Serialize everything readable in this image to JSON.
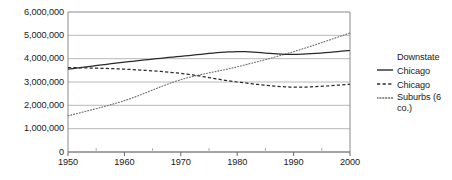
{
  "chart_data": {
    "type": "line",
    "title": "",
    "subtitle": "",
    "xlabel": "",
    "ylabel": "",
    "xlim": [
      1950,
      2000
    ],
    "ylim": [
      0,
      6000000
    ],
    "grid": true,
    "grid_axis": "y",
    "legend_position": "right",
    "x": [
      1950,
      1960,
      1970,
      1980,
      1990,
      2000
    ],
    "x_tick_labels": [
      "1950",
      "1960",
      "1970",
      "1980",
      "1990",
      "2000"
    ],
    "y_ticks": [
      0,
      1000000,
      2000000,
      3000000,
      4000000,
      5000000,
      6000000
    ],
    "y_tick_labels": [
      "0",
      "1,000,000",
      "2,000,000",
      "3,000,000",
      "4,000,000",
      "5,000,000",
      "6,000,000"
    ],
    "series": [
      {
        "name": "Downstate",
        "style": "solid",
        "color": "#2a2a2a",
        "values": [
          3550000,
          3850000,
          4100000,
          4300000,
          4180000,
          4350000
        ]
      },
      {
        "name": "Chicago",
        "style": "dashed",
        "color": "#2a2a2a",
        "values": [
          3620000,
          3550000,
          3370000,
          3000000,
          2780000,
          2900000
        ]
      },
      {
        "name": "Chicago Suburbs (6 co.)",
        "style": "dotted",
        "color": "#6b6b6b",
        "values": [
          1550000,
          2200000,
          3100000,
          3650000,
          4300000,
          5100000
        ]
      }
    ]
  },
  "axes": {
    "y_labels": [
      "6,000,000",
      "5,000,000",
      "4,000,000",
      "3,000,000",
      "2,000,000",
      "1,000,000",
      "0"
    ],
    "x_labels": [
      "1950",
      "1960",
      "1970",
      "1980",
      "1990",
      "2000"
    ]
  },
  "legend": {
    "items": [
      {
        "label": "Downstate",
        "style": "solid"
      },
      {
        "label": "Chicago",
        "style": "dashed"
      },
      {
        "label": "Chicago",
        "label2": "Suburbs (6 co.)",
        "style": "dotted"
      }
    ]
  },
  "colors": {
    "line_primary": "#2a2a2a",
    "line_secondary": "#6b6b6b",
    "gridline": "#b8b8b8",
    "axis": "#8a8a8a",
    "text": "#1a1a1a",
    "background": "#ffffff"
  }
}
